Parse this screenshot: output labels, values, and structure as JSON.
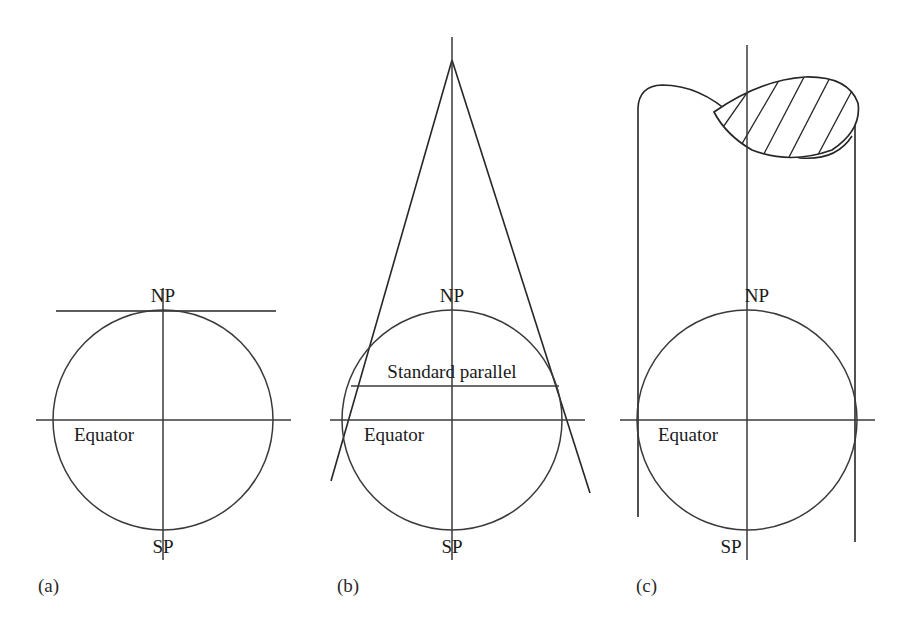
{
  "figure": {
    "background_color": "#ffffff",
    "line_color": "#262626",
    "width": 905,
    "height": 628
  },
  "panels": [
    {
      "id": "a",
      "label": "(a)",
      "surface": "plane",
      "labels": {
        "north_pole": "NP",
        "south_pole": "SP",
        "equator": "Equator"
      }
    },
    {
      "id": "b",
      "label": "(b)",
      "surface": "cone",
      "labels": {
        "north_pole": "NP",
        "south_pole": "SP",
        "equator": "Equator",
        "standard_parallel": "Standard parallel"
      }
    },
    {
      "id": "c",
      "label": "(c)",
      "surface": "cylinder",
      "labels": {
        "north_pole": "NP",
        "south_pole": "SP",
        "equator": "Equator"
      }
    }
  ],
  "geometry": {
    "panel_a": {
      "globe": {
        "cx": 163,
        "cy": 420,
        "r": 110
      },
      "axis": {
        "x": 163,
        "y1": 288,
        "y2": 560
      },
      "equator_line": {
        "x1": 36,
        "x2": 291,
        "y": 420
      },
      "tangent_plane": {
        "x1": 56,
        "x2": 276,
        "y": 311
      },
      "np_text": {
        "x": 163,
        "y": 302
      },
      "sp_text": {
        "x": 163,
        "y": 551
      },
      "equator_text": {
        "x": 75,
        "y": 440
      },
      "panel_text": {
        "x": 38,
        "y": 592
      }
    },
    "panel_b": {
      "globe": {
        "cx": 452,
        "cy": 420,
        "r": 110
      },
      "axis": {
        "x": 452,
        "y1": 37,
        "y2": 560
      },
      "equator_line": {
        "x1": 330,
        "x2": 585,
        "y": 420
      },
      "standard_parallel_line": {
        "x1": 352,
        "x2": 558,
        "y": 386
      },
      "cone_apex": {
        "x": 452,
        "y": 60
      },
      "cone_left_end": {
        "x": 331,
        "y": 481
      },
      "cone_right_end": {
        "x": 590,
        "y": 493
      },
      "np_text": {
        "x": 452,
        "y": 302
      },
      "sp_text": {
        "x": 452,
        "y": 551
      },
      "equator_text": {
        "x": 364,
        "y": 440
      },
      "standard_parallel_text": {
        "x": 452,
        "y": 377
      },
      "panel_text": {
        "x": 337,
        "y": 592
      }
    },
    "panel_c": {
      "globe": {
        "cx": 747,
        "cy": 420,
        "r": 110
      },
      "axis": {
        "x": 747,
        "y1": 45,
        "y2": 560
      },
      "equator_line": {
        "x1": 620,
        "x2": 875,
        "y": 420
      },
      "cyl_left": {
        "x": 638,
        "y_top": 108,
        "y_bottom": 517
      },
      "cyl_right": {
        "x": 855,
        "y_top": 110,
        "y_bottom": 542
      },
      "np_text": {
        "x": 755,
        "y": 302
      },
      "sp_text": {
        "x": 732,
        "y": 551
      },
      "equator_text": {
        "x": 659,
        "y": 440
      },
      "panel_text": {
        "x": 636,
        "y": 592
      },
      "hatch_count": 6
    }
  }
}
